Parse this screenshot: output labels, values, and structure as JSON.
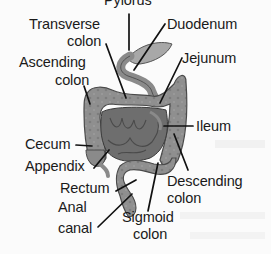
{
  "diagram": {
    "labels": {
      "pylorus": "Pylorus",
      "transverse_colon_line1": "Transverse",
      "transverse_colon_line2": "colon",
      "duodenum": "Duodenum",
      "ascending_colon_line1": "Ascending",
      "ascending_colon_line2": "colon",
      "jejunum": "Jejunum",
      "ileum": "Ileum",
      "cecum": "Cecum",
      "appendix": "Appendix",
      "rectum": "Rectum",
      "descending_colon_line1": "Descending",
      "descending_colon_line2": "colon",
      "anal_canal_line1": "Anal",
      "anal_canal_line2": "canal",
      "sigmoid_colon_line1": "Sigmoid",
      "sigmoid_colon_line2": "colon"
    },
    "colors": {
      "background": "#fbfbfb",
      "colon_fill": "#8f8f8f",
      "colon_edge": "#4a4a4a",
      "small_intestine_fill": "#6e6e6e",
      "stomach_fill": "#a8a8a8",
      "label_text": "#1a1a1a"
    }
  }
}
